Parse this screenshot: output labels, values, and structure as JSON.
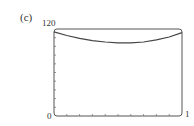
{
  "panel_label": "(c)",
  "axes": {
    "y_max_label": "120",
    "x_min_label": "0",
    "x_max_label": "1"
  },
  "chart_data": {
    "type": "line",
    "title": "",
    "xlabel": "",
    "ylabel": "",
    "xlim": [
      0,
      1
    ],
    "ylim": [
      0,
      120
    ],
    "grid": false,
    "x_tick_labels": [
      "0",
      "1"
    ],
    "y_tick_labels": [
      "0",
      "120"
    ],
    "x_minor_ticks": 10,
    "y_minor_ticks": 10,
    "series": [
      {
        "name": "curve",
        "x": [
          0.0,
          0.1,
          0.2,
          0.3,
          0.4,
          0.5,
          0.6,
          0.7,
          0.8,
          0.9,
          1.0
        ],
        "y": [
          116,
          111,
          107,
          104,
          102,
          101,
          101,
          102,
          105,
          109,
          115
        ]
      }
    ]
  }
}
